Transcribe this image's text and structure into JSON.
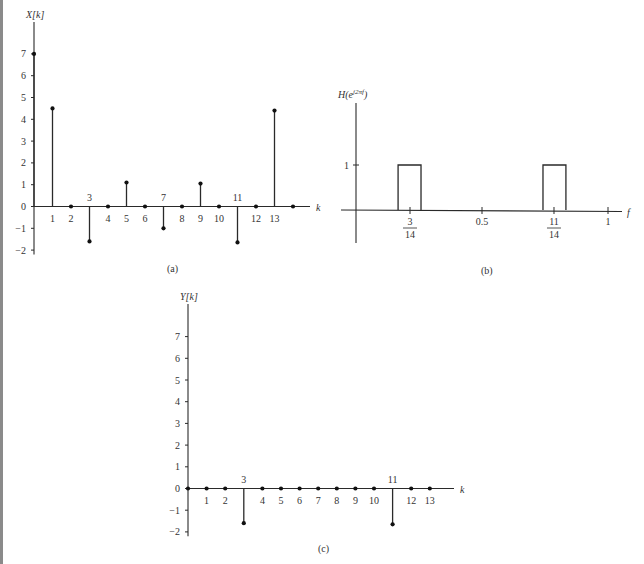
{
  "figure": {
    "panels": [
      {
        "id": "a",
        "caption": "(a)",
        "ylabel": "X[k]",
        "xlabel": "k"
      },
      {
        "id": "b",
        "caption": "(b)",
        "ylabel": "H(e^{j2πf})",
        "ylabel_base": "H(e",
        "ylabel_sup": "j2πf",
        "ylabel_close": ")",
        "xlabel": "f"
      },
      {
        "id": "c",
        "caption": "(c)",
        "ylabel": "Y[k]",
        "xlabel": "k"
      }
    ]
  },
  "chart_data": [
    {
      "type": "stem",
      "title": "(a)",
      "xlabel": "k",
      "ylabel": "X[k]",
      "x": [
        0,
        1,
        2,
        3,
        4,
        5,
        6,
        7,
        8,
        9,
        10,
        11,
        12,
        13,
        14
      ],
      "values": [
        7,
        4.5,
        0,
        -1.6,
        0,
        1.1,
        0,
        -1.0,
        0,
        1.05,
        0,
        -1.65,
        0,
        4.4,
        0
      ],
      "yticks": [
        -2,
        -1,
        0,
        1,
        2,
        3,
        4,
        5,
        6,
        7
      ],
      "xtick_labels_below": [
        "1",
        "2",
        "4",
        "5",
        "6",
        "8",
        "9",
        "10",
        "12",
        "13"
      ],
      "xtick_labels_above": [
        "3",
        "7",
        "11"
      ],
      "ylim": [
        -2,
        7.5
      ]
    },
    {
      "type": "line",
      "title": "(b)",
      "xlabel": "f",
      "ylabel": "H(e^{j2πf})",
      "description": "Ideal bandpass magnitude: H=1 in narrow bands centered at f=3/14 and f=11/14, 0 elsewhere",
      "bands": [
        {
          "center": "3/14",
          "center_value": 0.2143,
          "from": 0.167,
          "to": 0.258,
          "height": 1
        },
        {
          "center": "11/14",
          "center_value": 0.7857,
          "from": 0.742,
          "to": 0.833,
          "height": 1
        }
      ],
      "xticks": [
        {
          "value": 0.2143,
          "label": "3/14"
        },
        {
          "value": 0.5,
          "label": "0.5"
        },
        {
          "value": 0.7857,
          "label": "11/14"
        },
        {
          "value": 1,
          "label": "1"
        }
      ],
      "yticks": [
        {
          "value": 1,
          "label": "1"
        }
      ],
      "xlim": [
        0,
        1.05
      ],
      "ylim": [
        -0.7,
        2
      ]
    },
    {
      "type": "stem",
      "title": "(c)",
      "xlabel": "k",
      "ylabel": "Y[k]",
      "x": [
        0,
        1,
        2,
        3,
        4,
        5,
        6,
        7,
        8,
        9,
        10,
        11,
        12,
        13
      ],
      "values": [
        0,
        0,
        0,
        -1.6,
        0,
        0,
        0,
        0,
        0,
        0,
        0,
        -1.65,
        0,
        0
      ],
      "yticks": [
        -2,
        -1,
        0,
        1,
        2,
        3,
        4,
        5,
        6,
        7
      ],
      "xtick_labels_below": [
        "1",
        "2",
        "4",
        "5",
        "6",
        "7",
        "8",
        "9",
        "10",
        "12",
        "13"
      ],
      "xtick_labels_above": [
        "3",
        "11"
      ],
      "ylim": [
        -2,
        7.5
      ]
    }
  ]
}
